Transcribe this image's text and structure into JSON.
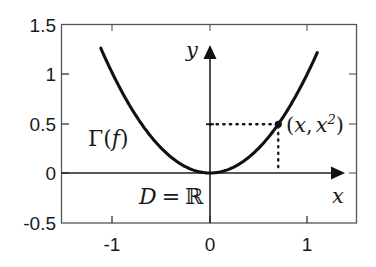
{
  "chart_data": {
    "type": "line",
    "title": "",
    "xlabel": "x",
    "ylabel": "y",
    "xlim": [
      -1.35,
      1.5
    ],
    "ylim": [
      -0.5,
      1.5
    ],
    "grid": false,
    "legend_position": "none",
    "x_ticks": [
      "-1",
      "0",
      "1"
    ],
    "x_tick_values": [
      -1,
      0,
      1
    ],
    "y_ticks": [
      "1.5",
      "1",
      "0.5",
      "0",
      "-0.5"
    ],
    "y_tick_values": [
      1.5,
      1,
      0.5,
      0,
      -0.5
    ],
    "series": [
      {
        "name": "f(x) = x^2",
        "x": [
          -1.12,
          -1.0,
          -0.8,
          -0.6,
          -0.4,
          -0.2,
          0.0,
          0.2,
          0.4,
          0.6,
          0.8,
          1.0,
          1.1
        ],
        "values": [
          1.2544,
          1.0,
          0.64,
          0.36,
          0.16,
          0.04,
          0.0,
          0.04,
          0.16,
          0.36,
          0.64,
          1.0,
          1.21
        ]
      }
    ],
    "points": [
      {
        "name": "generic-point",
        "x": 0.7,
        "y": 0.49,
        "label": "(x, x2)",
        "marker": "filled-dot",
        "guide_lines": "dotted to x-axis and y-axis"
      }
    ],
    "annotations": [
      {
        "name": "graph-label",
        "text": "Γ(f)",
        "x": -0.82,
        "y": 0.33
      },
      {
        "name": "domain-label",
        "text": "D = ℝ",
        "x": -0.33,
        "y": -0.24
      },
      {
        "name": "point-label",
        "text": "(x, x2)",
        "x": 0.8,
        "y": 0.49
      }
    ]
  },
  "labels": {
    "y_axis_name": "y",
    "x_axis_name": "x",
    "graph_symbol_gamma": "Γ",
    "graph_symbol_open": "(",
    "graph_symbol_f": "f",
    "graph_symbol_close": ")",
    "domain_d": "D",
    "domain_equals": "=",
    "domain_r": "ℝ",
    "point_open": "(",
    "point_x1": "x",
    "point_comma": ",",
    "point_x2": "x",
    "point_exp": "2",
    "point_close": ")"
  },
  "y_tick_labels": [
    "1.5",
    "1",
    "0.5",
    "0",
    "-0.5"
  ],
  "x_tick_labels": [
    "-1",
    "0",
    "1"
  ],
  "colors": {
    "curve": "#111111",
    "axis": "#333333",
    "frame": "#555555",
    "text": "#1a1a1a",
    "background": "#ffffff"
  }
}
